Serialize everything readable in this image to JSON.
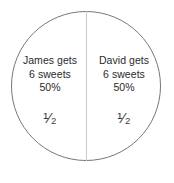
{
  "diagram": {
    "type": "pie-chart-two-equal-halves",
    "shape": "circle",
    "total_sweets": 12,
    "left_half": {
      "line1": "James gets",
      "line2": "6 sweets",
      "line3": "50%",
      "fraction": "¹⁄₂"
    },
    "right_half": {
      "line1": "David gets",
      "line2": "6 sweets",
      "line3": "50%",
      "fraction": "¹⁄₂"
    }
  },
  "chart_data": {
    "type": "pie",
    "title": "",
    "categories": [
      "James",
      "David"
    ],
    "values": [
      6,
      6
    ],
    "percentages": [
      50,
      50
    ],
    "fractions": [
      "1/2",
      "1/2"
    ],
    "unit": "sweets",
    "legend": "none",
    "labels": [
      "James gets 6 sweets 50% 1/2",
      "David gets 6 sweets 50% 1/2"
    ]
  },
  "colors": {
    "background": "#ffffff",
    "circle_stroke": "#777777",
    "divider": "#c9c9c9",
    "text": "#2b2b2b"
  }
}
